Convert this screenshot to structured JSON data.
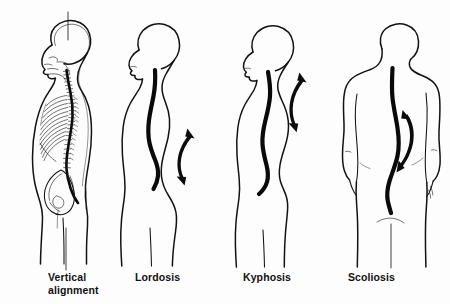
{
  "diagram": {
    "background_color": "#fdfdfd",
    "ink_color": "#121212",
    "figure_count": 4,
    "view_note": "Line-art medical illustration of four standing human figures",
    "labels": {
      "vertical": "Vertical\nalignment",
      "lordosis": "Lordosis",
      "kyphosis": "Kyphosis",
      "scoliosis": "Scoliosis"
    },
    "figures": [
      {
        "id": "vertical-alignment",
        "label": "Vertical alignment",
        "view": "lateral (side) profile, facing left",
        "detail": "skeletal overlay showing skull, cervical, thoracic and lumbar vertebrae, rib cage and pelvis",
        "plumb_line": "vertical reference line through crown of head down past pelvis",
        "arrow": "none"
      },
      {
        "id": "lordosis",
        "label": "Lordosis",
        "view": "lateral (side) profile, facing left",
        "detail": "body silhouette with exaggerated inward lumbar curve",
        "plumb_line": "none",
        "arrow": "curved double-headed arrow at lower back"
      },
      {
        "id": "kyphosis",
        "label": "Kyphosis",
        "view": "lateral (side) profile, facing left",
        "detail": "body silhouette with exaggerated outward thoracic curve, rounded upper back",
        "plumb_line": "none",
        "arrow": "curved double-headed arrow at upper back"
      },
      {
        "id": "scoliosis",
        "label": "Scoliosis",
        "view": "posterior (back) view, arms at sides",
        "detail": "body silhouette with lateral S-shaped curvature of the spine",
        "plumb_line": "short vertical line below gluteal cleft",
        "arrow": "curved double-headed arrow beside the spine"
      }
    ]
  }
}
